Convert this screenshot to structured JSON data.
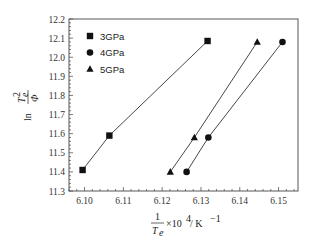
{
  "chart_data": {
    "type": "line",
    "title": "",
    "xlabel": "1/T_e ×10^4 / K^-1",
    "ylabel": "ln(T_e^2/Φ)",
    "xlim": [
      6.096,
      6.155
    ],
    "ylim": [
      11.3,
      12.2
    ],
    "xticks": [
      6.1,
      6.11,
      6.12,
      6.13,
      6.14,
      6.15
    ],
    "xtick_labels": [
      "6.10",
      "6.11",
      "6.12",
      "6.13",
      "6.14",
      "6.15"
    ],
    "yticks": [
      11.3,
      11.4,
      11.5,
      11.6,
      11.7,
      11.8,
      11.9,
      12.0,
      12.1,
      12.2
    ],
    "ytick_labels": [
      "11.3",
      "11.4",
      "11.5",
      "11.6",
      "11.7",
      "11.8",
      "11.9",
      "12.0",
      "12.1",
      "12.2"
    ],
    "grid": false,
    "legend_position": "upper left",
    "series": [
      {
        "name": "3GPa",
        "marker": "square",
        "x": [
          6.0995,
          6.1064,
          6.1317
        ],
        "y": [
          11.41,
          11.59,
          12.085
        ]
      },
      {
        "name": "4GPa",
        "marker": "circle",
        "x": [
          6.1263,
          6.1319,
          6.151
        ],
        "y": [
          11.4,
          11.58,
          12.08
        ]
      },
      {
        "name": "5GPa",
        "marker": "triangle",
        "x": [
          6.1221,
          6.1283,
          6.1445
        ],
        "y": [
          11.4,
          11.58,
          12.08
        ]
      }
    ]
  },
  "legend": {
    "items": [
      {
        "label": "3GPa",
        "marker": "square"
      },
      {
        "label": "4GPa",
        "marker": "circle"
      },
      {
        "label": "5GPa",
        "marker": "triangle"
      }
    ]
  },
  "axes": {
    "x_label": {
      "numerator": "1",
      "denominator": "T",
      "denominator_sub": "e",
      "suffix": "×10",
      "suffix_exp": "4",
      "unit": " / K",
      "unit_exp": "−1"
    },
    "y_label": {
      "prefix": "ln",
      "numerator": "T",
      "numerator_sub": "e",
      "numerator_exp": "2",
      "denominator": "Φ"
    }
  },
  "colors": {
    "line": "#333333",
    "marker": "#111111",
    "axis": "#444444"
  }
}
